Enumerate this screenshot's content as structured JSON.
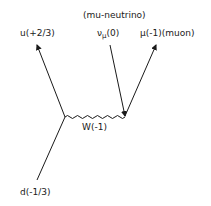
{
  "diagram": {
    "type": "feynman-diagram",
    "process": "beta-like decay of d quark via W boson to muon",
    "labels": {
      "mu_neutrino_name": "(mu-neutrino)",
      "mu_neutrino_symbol": "ν",
      "mu_neutrino_sub": "μ",
      "mu_neutrino_charge": "(0)",
      "muon": "μ(-1)(muon)",
      "up_quark": "u(+2/3)",
      "down_quark": "d(-1/3)",
      "w_boson": "W(-1)"
    },
    "particles": [
      {
        "name": "u",
        "charge": "+2/3",
        "direction": "outgoing"
      },
      {
        "name": "d",
        "charge": "-1/3",
        "direction": "incoming"
      },
      {
        "name": "W",
        "charge": "-1",
        "type": "boson-propagator"
      },
      {
        "name": "ν_μ",
        "charge": "0",
        "direction": "incoming-antiparticle-line"
      },
      {
        "name": "μ",
        "charge": "-1",
        "direction": "outgoing"
      }
    ],
    "colors": {
      "ink": "#1a1a1a",
      "background": "#ffffff"
    }
  }
}
